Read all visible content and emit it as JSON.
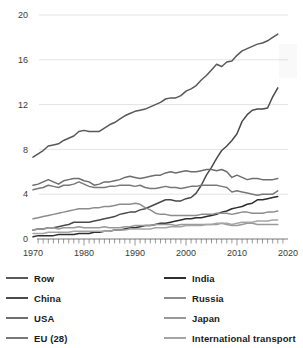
{
  "chart_data": {
    "type": "line",
    "title": "",
    "subtitle": "",
    "xlabel": "",
    "ylabel": "",
    "xlim": [
      1970,
      2020
    ],
    "ylim": [
      0,
      20
    ],
    "xticks": [
      1970,
      1980,
      1990,
      2000,
      2010,
      2020
    ],
    "yticks": [
      0,
      4,
      8,
      12,
      16,
      20
    ],
    "xtick_labels": [
      "1970",
      "1980",
      "1990",
      "2000",
      "2010",
      "2020"
    ],
    "ytick_labels": [
      "0",
      "4",
      "8",
      "12",
      "16",
      "20"
    ],
    "grid": "horizontal",
    "minor_xticks": "annual",
    "legend_position": "below",
    "legend_columns": 2,
    "x": [
      1970,
      1971,
      1972,
      1973,
      1974,
      1975,
      1976,
      1977,
      1978,
      1979,
      1980,
      1981,
      1982,
      1983,
      1984,
      1985,
      1986,
      1987,
      1988,
      1989,
      1990,
      1991,
      1992,
      1993,
      1994,
      1995,
      1996,
      1997,
      1998,
      1999,
      2000,
      2001,
      2002,
      2003,
      2004,
      2005,
      2006,
      2007,
      2008,
      2009,
      2010,
      2011,
      2012,
      2013,
      2014,
      2015,
      2016,
      2017,
      2018
    ],
    "series": [
      {
        "name": "Row",
        "color": "#595959",
        "values": [
          7.3,
          7.6,
          7.9,
          8.3,
          8.4,
          8.5,
          8.8,
          9.0,
          9.2,
          9.6,
          9.7,
          9.6,
          9.6,
          9.6,
          9.9,
          10.2,
          10.4,
          10.7,
          11.0,
          11.2,
          11.4,
          11.5,
          11.6,
          11.8,
          12.0,
          12.2,
          12.5,
          12.6,
          12.6,
          12.8,
          13.2,
          13.4,
          13.7,
          14.2,
          14.6,
          15.1,
          15.6,
          15.4,
          15.8,
          15.9,
          16.4,
          16.8,
          17.0,
          17.2,
          17.4,
          17.5,
          17.7,
          18.0,
          18.3
        ]
      },
      {
        "name": "China",
        "color": "#4a4a4a",
        "values": [
          0.8,
          0.9,
          0.9,
          1.0,
          1.0,
          1.1,
          1.2,
          1.3,
          1.5,
          1.5,
          1.5,
          1.5,
          1.6,
          1.7,
          1.8,
          1.9,
          2.0,
          2.2,
          2.3,
          2.4,
          2.4,
          2.6,
          2.7,
          2.9,
          3.1,
          3.3,
          3.5,
          3.5,
          3.4,
          3.4,
          3.6,
          3.7,
          4.1,
          4.8,
          5.7,
          6.4,
          7.2,
          7.9,
          8.3,
          8.8,
          9.4,
          10.5,
          11.1,
          11.5,
          11.6,
          11.6,
          11.7,
          12.7,
          13.5
        ]
      },
      {
        "name": "USA",
        "color": "#6e6e6e",
        "values": [
          4.8,
          4.9,
          5.1,
          5.3,
          5.1,
          4.9,
          5.2,
          5.3,
          5.4,
          5.4,
          5.2,
          5.1,
          4.8,
          4.9,
          5.1,
          5.1,
          5.2,
          5.3,
          5.5,
          5.6,
          5.5,
          5.4,
          5.5,
          5.6,
          5.7,
          5.7,
          5.9,
          6.0,
          5.9,
          6.0,
          6.1,
          6.0,
          6.0,
          6.1,
          6.2,
          6.2,
          6.1,
          6.2,
          6.0,
          5.5,
          5.7,
          5.5,
          5.3,
          5.4,
          5.4,
          5.3,
          5.3,
          5.3,
          5.4
        ]
      },
      {
        "name": "EU (28)",
        "color": "#787878",
        "values": [
          4.4,
          4.5,
          4.6,
          4.8,
          4.7,
          4.6,
          4.8,
          4.8,
          4.9,
          5.1,
          4.9,
          4.7,
          4.6,
          4.6,
          4.6,
          4.7,
          4.7,
          4.8,
          4.8,
          4.8,
          4.7,
          4.8,
          4.6,
          4.5,
          4.5,
          4.6,
          4.7,
          4.6,
          4.6,
          4.5,
          4.6,
          4.7,
          4.7,
          4.8,
          4.8,
          4.8,
          4.8,
          4.7,
          4.6,
          4.2,
          4.3,
          4.2,
          4.1,
          4.0,
          3.9,
          4.0,
          4.0,
          4.0,
          4.3
        ]
      },
      {
        "name": "India",
        "color": "#2e2e2e",
        "values": [
          0.2,
          0.3,
          0.3,
          0.3,
          0.3,
          0.4,
          0.4,
          0.4,
          0.4,
          0.5,
          0.5,
          0.5,
          0.6,
          0.6,
          0.7,
          0.7,
          0.8,
          0.8,
          0.9,
          1.0,
          1.0,
          1.1,
          1.2,
          1.2,
          1.3,
          1.4,
          1.4,
          1.5,
          1.6,
          1.7,
          1.8,
          1.8,
          1.9,
          1.9,
          2.0,
          2.1,
          2.2,
          2.4,
          2.5,
          2.7,
          2.8,
          2.9,
          3.1,
          3.2,
          3.5,
          3.5,
          3.6,
          3.7,
          3.8
        ]
      },
      {
        "name": "Russia",
        "color": "#8c8c8c",
        "values": [
          1.8,
          1.9,
          2.0,
          2.1,
          2.2,
          2.3,
          2.4,
          2.5,
          2.6,
          2.7,
          2.7,
          2.7,
          2.8,
          2.8,
          2.9,
          2.9,
          3.0,
          3.1,
          3.1,
          3.1,
          3.2,
          3.1,
          2.8,
          2.6,
          2.3,
          2.2,
          2.2,
          2.1,
          2.1,
          2.1,
          2.1,
          2.1,
          2.1,
          2.2,
          2.2,
          2.2,
          2.3,
          2.3,
          2.3,
          2.2,
          2.3,
          2.4,
          2.4,
          2.3,
          2.3,
          2.3,
          2.4,
          2.4,
          2.5
        ]
      },
      {
        "name": "Japan",
        "color": "#9a9a9a",
        "values": [
          0.8,
          0.9,
          0.9,
          1.0,
          1.0,
          0.9,
          1.0,
          1.0,
          1.0,
          1.1,
          1.0,
          1.0,
          1.0,
          1.0,
          1.1,
          1.0,
          1.0,
          1.0,
          1.1,
          1.1,
          1.2,
          1.2,
          1.2,
          1.2,
          1.3,
          1.3,
          1.3,
          1.3,
          1.2,
          1.3,
          1.3,
          1.3,
          1.3,
          1.3,
          1.3,
          1.3,
          1.3,
          1.4,
          1.3,
          1.2,
          1.2,
          1.3,
          1.4,
          1.4,
          1.3,
          1.3,
          1.3,
          1.3,
          1.3
        ]
      },
      {
        "name": "International transport",
        "color": "#a5a5a5",
        "values": [
          0.5,
          0.5,
          0.5,
          0.6,
          0.6,
          0.6,
          0.6,
          0.6,
          0.7,
          0.7,
          0.7,
          0.7,
          0.7,
          0.7,
          0.7,
          0.7,
          0.8,
          0.8,
          0.8,
          0.9,
          0.9,
          0.9,
          0.9,
          0.9,
          1.0,
          1.0,
          1.0,
          1.1,
          1.1,
          1.1,
          1.2,
          1.2,
          1.2,
          1.2,
          1.3,
          1.3,
          1.4,
          1.4,
          1.4,
          1.3,
          1.4,
          1.5,
          1.5,
          1.5,
          1.6,
          1.6,
          1.6,
          1.7,
          1.7
        ]
      }
    ]
  },
  "legend": {
    "items": [
      {
        "label": "Row",
        "color": "#595959"
      },
      {
        "label": "India",
        "color": "#2e2e2e"
      },
      {
        "label": "China",
        "color": "#4a4a4a"
      },
      {
        "label": "Russia",
        "color": "#8c8c8c"
      },
      {
        "label": "USA",
        "color": "#6e6e6e"
      },
      {
        "label": "Japan",
        "color": "#9a9a9a"
      },
      {
        "label": "EU (28)",
        "color": "#787878"
      },
      {
        "label": "International transport",
        "color": "#a5a5a5"
      }
    ]
  }
}
